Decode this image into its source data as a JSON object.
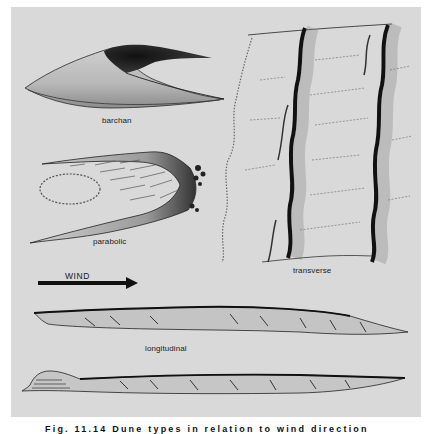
{
  "figure": {
    "labels": {
      "barchan": "barchan",
      "parabolic": "parabolic",
      "transverse": "transverse",
      "longitudinal": "longitudinal",
      "wind": "WIND"
    },
    "caption": "Fig. 11.14  Dune types in relation to wind direction"
  },
  "colors": {
    "panel_background": "#d9d9d9",
    "ink": "#1a1a1a",
    "page": "#ffffff"
  }
}
